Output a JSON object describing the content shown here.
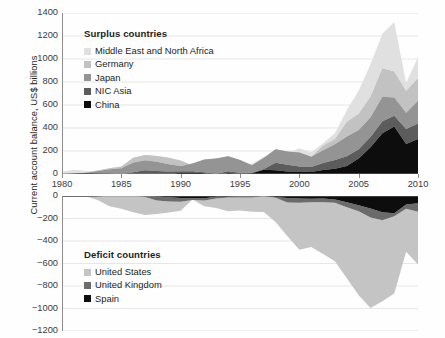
{
  "chart_data": {
    "type": "area",
    "title": "",
    "xlabel": "",
    "ylabel": "Current account balance, US$ billions",
    "stacking": "stacked",
    "grid": true,
    "x": [
      1980,
      1981,
      1982,
      1983,
      1984,
      1985,
      1986,
      1987,
      1988,
      1989,
      1990,
      1991,
      1992,
      1993,
      1994,
      1995,
      1996,
      1997,
      1998,
      1999,
      2000,
      2001,
      2002,
      2003,
      2004,
      2005,
      2006,
      2007,
      2008,
      2009,
      2010
    ],
    "xlim": [
      1980,
      2010
    ],
    "xticks": [
      "1980",
      "1985",
      "1990",
      "1995",
      "2000",
      "2005",
      "2010"
    ],
    "panels": [
      {
        "name": "surplus",
        "ylim": [
          0,
          1400
        ],
        "yticks": [
          "0",
          "200",
          "400",
          "600",
          "800",
          "1000",
          "1200",
          "1400"
        ],
        "legend_title": "Surplus countries",
        "legend_position": "upper-left",
        "series": [
          {
            "name": "China",
            "color": "#0d0d0d",
            "values": [
              0,
              2,
              6,
              5,
              2,
              -12,
              -7,
              0,
              -4,
              -4,
              12,
              13,
              6,
              -12,
              8,
              2,
              7,
              37,
              32,
              21,
              21,
              17,
              35,
              46,
              69,
              134,
              232,
              354,
              412,
              261,
              305
            ]
          },
          {
            "name": "NIC Asia",
            "color": "#5c5c5c",
            "values": [
              -5,
              -4,
              -2,
              0,
              5,
              10,
              22,
              32,
              30,
              25,
              13,
              10,
              9,
              15,
              17,
              8,
              4,
              6,
              65,
              60,
              45,
              44,
              60,
              76,
              85,
              82,
              90,
              105,
              95,
              130,
              135
            ]
          },
          {
            "name": "Japan",
            "color": "#949494",
            "values": [
              -11,
              5,
              7,
              21,
              35,
              51,
              86,
              87,
              80,
              63,
              45,
              68,
              112,
              132,
              130,
              111,
              66,
              97,
              119,
              115,
              120,
              88,
              112,
              136,
              172,
              166,
              171,
              212,
              159,
              142,
              196
            ]
          },
          {
            "name": "Germany",
            "color": "#c2c2c2",
            "values": [
              -14,
              -5,
              5,
              5,
              9,
              17,
              40,
              46,
              50,
              57,
              48,
              -18,
              -19,
              -14,
              -30,
              -30,
              -13,
              -9,
              -16,
              -27,
              -32,
              1,
              41,
              47,
              128,
              141,
              182,
              249,
              226,
              189,
              199
            ]
          },
          {
            "name": "Middle East and North Africa",
            "color": "#e0e0e0",
            "values": [
              50,
              40,
              10,
              -5,
              -8,
              -2,
              -18,
              -2,
              -20,
              -4,
              4,
              -60,
              -25,
              -25,
              -8,
              2,
              22,
              18,
              -26,
              11,
              70,
              40,
              20,
              50,
              100,
              200,
              280,
              300,
              430,
              70,
              180
            ]
          }
        ]
      },
      {
        "name": "deficit",
        "ylim": [
          -1200,
          0
        ],
        "yticks": [
          "0",
          "-200",
          "-400",
          "-600",
          "-800",
          "-1000",
          "-1200"
        ],
        "legend_title": "Deficit countries",
        "legend_position": "lower-left",
        "series": [
          {
            "name": "Spain",
            "color": "#0d0d0d",
            "values": [
              -5,
              -5,
              -4,
              -2,
              2,
              2,
              4,
              0,
              -4,
              -11,
              -18,
              -20,
              -21,
              -6,
              -6,
              -2,
              -1,
              0,
              -8,
              -18,
              -23,
              -24,
              -23,
              -31,
              -55,
              -83,
              -111,
              -144,
              -154,
              -75,
              -64
            ]
          },
          {
            "name": "United Kingdom",
            "color": "#6b6b6b",
            "values": [
              7,
              14,
              7,
              5,
              2,
              3,
              -1,
              -8,
              -36,
              -37,
              -33,
              -15,
              -19,
              -16,
              -8,
              -12,
              -13,
              -2,
              -8,
              -39,
              -38,
              -31,
              -33,
              -29,
              -45,
              -52,
              -81,
              -72,
              -25,
              -39,
              -75
            ]
          },
          {
            "name": "United States",
            "color": "#c4c4c4",
            "values": [
              2,
              5,
              -5,
              -38,
              -94,
              -118,
              -147,
              -160,
              -121,
              -99,
              -79,
              3,
              -50,
              -85,
              -122,
              -114,
              -125,
              -141,
              -214,
              -300,
              -417,
              -398,
              -459,
              -521,
              -631,
              -748,
              -804,
              -719,
              -687,
              -381,
              -470
            ]
          }
        ]
      }
    ]
  }
}
